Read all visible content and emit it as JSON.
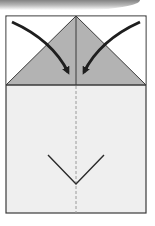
{
  "diagram": {
    "type": "origami-fold-step",
    "colors": {
      "paper": "#efefef",
      "paper_top_white": "#ffffff",
      "folded_flap": "#b3b3b3",
      "outline": "#3a3a3a",
      "arrow": "#1e1e1e",
      "dashed_line": "#9a9a9a",
      "valley_mark": "#2a2a2a"
    },
    "paper": {
      "x": 6,
      "y": 16,
      "width": 140,
      "height": 197
    },
    "triangle_flap": {
      "apex": [
        76,
        16
      ],
      "left": [
        6,
        85
      ],
      "right": [
        146,
        85
      ]
    },
    "center_crease": {
      "x": 76,
      "from_y": 16,
      "to_y": 85,
      "style": "solid"
    },
    "center_dashed_line": {
      "x": 76,
      "from_y": 85,
      "to_y": 213,
      "style": "dashed"
    },
    "arrows": [
      {
        "name": "left-fold-arrow",
        "from": [
          12,
          22
        ],
        "to": [
          69,
          78
        ]
      },
      {
        "name": "right-fold-arrow",
        "from": [
          140,
          22
        ],
        "to": [
          83,
          78
        ]
      }
    ],
    "v_mark": {
      "left": [
        48,
        155
      ],
      "bottom": [
        76,
        184
      ],
      "right": [
        104,
        155
      ]
    }
  }
}
